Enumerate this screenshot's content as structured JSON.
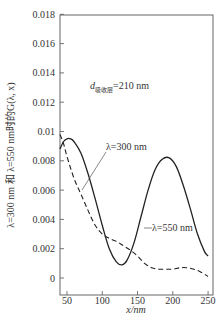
{
  "chart_data": {
    "type": "line",
    "title": "",
    "xlabel": "x/nm",
    "ylabel": "λ=300 nm 和 λ=550 nm时的G(λ, x)",
    "xlim": [
      40,
      250
    ],
    "ylim": [
      0,
      0.019
    ],
    "x_ticks": [
      50,
      100,
      150,
      200,
      250
    ],
    "x_tick_labels": [
      "50",
      "100",
      "150",
      "200",
      "250"
    ],
    "y_ticks": [
      0,
      0.002,
      0.004,
      0.006,
      0.008,
      0.01,
      0.012,
      0.014,
      0.016,
      0.018
    ],
    "y_tick_labels": [
      "0",
      "0.002",
      "0.004",
      "0.006",
      "0.008",
      "0.01",
      "0.012",
      "0.014",
      "0.016",
      "0.018"
    ],
    "grid": false,
    "legend": "inline annotations",
    "series": [
      {
        "name": "λ=550 nm",
        "style": "solid",
        "x": [
          40,
          45,
          50,
          55,
          60,
          70,
          80,
          90,
          100,
          110,
          120,
          128,
          135,
          145,
          155,
          165,
          175,
          185,
          195,
          205,
          215,
          225,
          235,
          245,
          250
        ],
        "y": [
          0.0088,
          0.0093,
          0.0095,
          0.0095,
          0.0093,
          0.0085,
          0.0071,
          0.0054,
          0.0036,
          0.002,
          0.0011,
          0.0009,
          0.0012,
          0.0024,
          0.0042,
          0.006,
          0.0074,
          0.0081,
          0.0082,
          0.0076,
          0.0063,
          0.0047,
          0.003,
          0.0018,
          0.0015
        ]
      },
      {
        "name": "λ=300 nm",
        "style": "dashed",
        "x": [
          40,
          45,
          50,
          60,
          70,
          80,
          90,
          100,
          110,
          120,
          130,
          140,
          150,
          160,
          170,
          180,
          190,
          200,
          210,
          220,
          230,
          240,
          250
        ],
        "y": [
          0.0098,
          0.0092,
          0.0083,
          0.0068,
          0.0057,
          0.0046,
          0.0036,
          0.003,
          0.0027,
          0.0025,
          0.0022,
          0.0019,
          0.0015,
          0.001,
          0.0007,
          0.0006,
          0.0006,
          0.0006,
          0.0007,
          0.0007,
          0.0006,
          0.0004,
          0.0001
        ]
      }
    ],
    "annotations": [
      {
        "text": "d",
        "subscript": "吸收层",
        "suffix": "=210 nm"
      },
      {
        "text": "λ=300 nm",
        "points_to": "dashed"
      },
      {
        "text": "λ=550 nm",
        "points_to": "solid"
      }
    ]
  },
  "labels": {
    "xlabel": "x/nm",
    "ylabel": "λ=300 nm 和 λ=550 nm时的G(λ, x)",
    "anno_d": "d",
    "anno_d_sub": "吸收层",
    "anno_d_val": "=210 nm",
    "anno_300": "λ=300 nm",
    "anno_550": "λ=550 nm"
  }
}
